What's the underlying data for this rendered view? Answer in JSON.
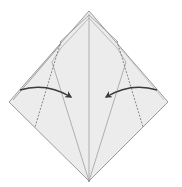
{
  "diagram": {
    "title": "Origami fold diagram: fold both side flaps to the center crease",
    "type": "origami-instruction",
    "colors": {
      "background": "#ffffff",
      "paper": "#ececec",
      "edge": "#9a9a9a",
      "crease": "#a8a8a8",
      "dashed_fold": "#7a7a7a",
      "arrow": "#3a3a3a"
    },
    "shape": {
      "name": "diamond",
      "vertices": {
        "top": [
          89,
          11
        ],
        "left": [
          9,
          102
        ],
        "right": [
          168,
          102
        ],
        "bottom": [
          89,
          181
        ]
      }
    },
    "lines": [
      {
        "name": "center-crease",
        "style": "solid",
        "from": [
          89,
          14
        ],
        "to": [
          89,
          181
        ]
      },
      {
        "name": "left-inner-crease",
        "style": "solid",
        "from": [
          52,
          62
        ],
        "to": [
          89,
          181
        ]
      },
      {
        "name": "right-inner-crease",
        "style": "solid",
        "from": [
          126,
          62
        ],
        "to": [
          89,
          181
        ]
      },
      {
        "name": "left-valley-fold",
        "style": "dashed",
        "from": [
          61,
          41
        ],
        "to": [
          35,
          127
        ]
      },
      {
        "name": "right-valley-fold",
        "style": "dashed",
        "from": [
          117,
          41
        ],
        "to": [
          143,
          127
        ]
      }
    ],
    "arrows": [
      {
        "name": "left-fold-arrow",
        "direction": "right",
        "from": [
          20,
          90
        ],
        "to": [
          71,
          97
        ]
      },
      {
        "name": "right-fold-arrow",
        "direction": "left",
        "from": [
          156,
          90
        ],
        "to": [
          106,
          97
        ]
      }
    ]
  }
}
